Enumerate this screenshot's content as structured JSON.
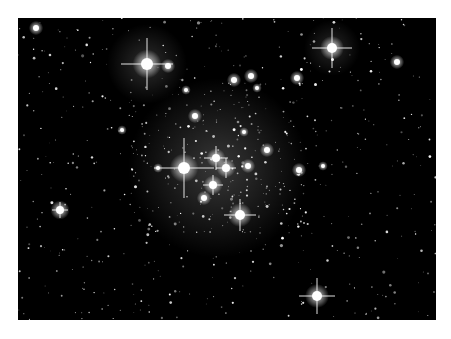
{
  "image": {
    "subject": "open star cluster photograph",
    "background": "#000000",
    "page_background": "#ffffff",
    "frame": {
      "x": 18,
      "y": 18,
      "width": 418,
      "height": 302
    },
    "bright_stars": [
      {
        "x": 129,
        "y": 46,
        "r": 6,
        "spikes": 26
      },
      {
        "x": 150,
        "y": 48,
        "r": 3,
        "spikes": 0
      },
      {
        "x": 314,
        "y": 30,
        "r": 5,
        "spikes": 20
      },
      {
        "x": 379,
        "y": 44,
        "r": 3,
        "spikes": 0
      },
      {
        "x": 166,
        "y": 150,
        "r": 6,
        "spikes": 30
      },
      {
        "x": 198,
        "y": 140,
        "r": 4,
        "spikes": 12
      },
      {
        "x": 208,
        "y": 150,
        "r": 4,
        "spikes": 10
      },
      {
        "x": 222,
        "y": 197,
        "r": 5,
        "spikes": 16
      },
      {
        "x": 195,
        "y": 167,
        "r": 4,
        "spikes": 10
      },
      {
        "x": 299,
        "y": 278,
        "r": 5,
        "spikes": 18
      },
      {
        "x": 42,
        "y": 192,
        "r": 4,
        "spikes": 8
      },
      {
        "x": 233,
        "y": 58,
        "r": 3,
        "spikes": 0
      },
      {
        "x": 216,
        "y": 62,
        "r": 3,
        "spikes": 0
      },
      {
        "x": 279,
        "y": 60,
        "r": 3,
        "spikes": 0
      },
      {
        "x": 177,
        "y": 98,
        "r": 3,
        "spikes": 0
      },
      {
        "x": 249,
        "y": 132,
        "r": 3,
        "spikes": 0
      },
      {
        "x": 281,
        "y": 152,
        "r": 3,
        "spikes": 0
      },
      {
        "x": 239,
        "y": 70,
        "r": 2,
        "spikes": 0
      },
      {
        "x": 168,
        "y": 72,
        "r": 2,
        "spikes": 0
      },
      {
        "x": 104,
        "y": 112,
        "r": 2,
        "spikes": 0
      },
      {
        "x": 18,
        "y": 10,
        "r": 3,
        "spikes": 0
      },
      {
        "x": 226,
        "y": 114,
        "r": 2,
        "spikes": 0
      },
      {
        "x": 305,
        "y": 148,
        "r": 2,
        "spikes": 0
      },
      {
        "x": 186,
        "y": 180,
        "r": 3,
        "spikes": 0
      },
      {
        "x": 230,
        "y": 148,
        "r": 3,
        "spikes": 0
      },
      {
        "x": 140,
        "y": 150,
        "r": 2,
        "spikes": 0
      }
    ],
    "glow": [
      {
        "x": 200,
        "y": 150,
        "r": 90,
        "opacity": 0.22
      },
      {
        "x": 129,
        "y": 46,
        "r": 40,
        "opacity": 0.18
      },
      {
        "x": 314,
        "y": 30,
        "r": 28,
        "opacity": 0.15
      }
    ],
    "faint_star_count": 700,
    "faint_seed": 7
  }
}
